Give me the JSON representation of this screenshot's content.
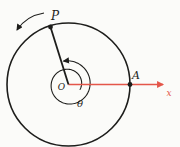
{
  "figure": {
    "colors": {
      "ink": "#1d1d1b",
      "axis_red": "#e4564a",
      "background": "#fbfbf9"
    },
    "labels": {
      "point_P": "P",
      "point_A": "A",
      "origin": "O",
      "angle": "θ",
      "axis_x": "x"
    },
    "geometry": {
      "center": {
        "x": 68.5,
        "y": 84.5
      },
      "radius": 61.5,
      "point_P": {
        "x": 50.5,
        "y": 27
      },
      "point_A": {
        "x": 130.0,
        "y": 84.5
      },
      "dot_radius": 2.4,
      "axis_end_x": 163,
      "spiral": {
        "start_deg": -25,
        "end_deg": 462,
        "start_r": 12.5,
        "end_r": 24
      },
      "ccw_arrow": {
        "from": {
          "x": 44,
          "y": 13
        },
        "ctrl": {
          "x": 26,
          "y": 16
        },
        "to": {
          "x": 17,
          "y": 30
        }
      },
      "label_pos": {
        "P": {
          "x": 55,
          "y": 20,
          "size": 12
        },
        "A": {
          "x": 136,
          "y": 79,
          "size": 11
        },
        "O": {
          "x": 61.5,
          "y": 90,
          "size": 9
        },
        "theta": {
          "x": 80,
          "y": 107,
          "size": 10
        },
        "x": {
          "x": 169,
          "y": 96,
          "size": 9
        }
      }
    }
  }
}
